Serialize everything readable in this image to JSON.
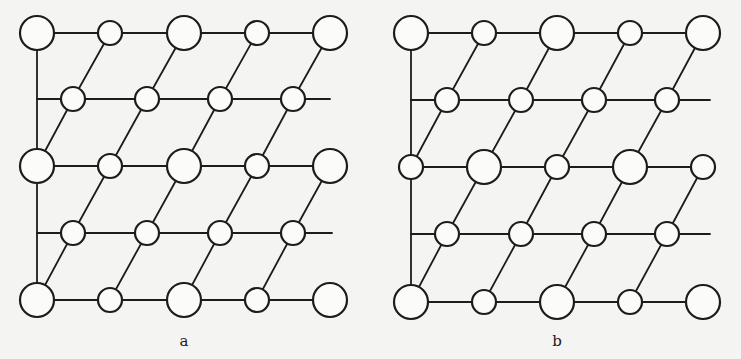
{
  "figure": {
    "colors": {
      "background": "#f4f4f2",
      "stroke": "#1c1c1c",
      "atom_fill": "#fbfbf9"
    },
    "radius": {
      "large": 17,
      "small": 12
    }
  },
  "panels": [
    {
      "id": "a",
      "label": "a",
      "label_pos": [
        184,
        346
      ],
      "vertical_line": {
        "x": 37,
        "y1": 33,
        "y2": 300
      },
      "rows": [
        {
          "y": 33,
          "line_end": 330,
          "atoms": [
            [
              37,
              "L"
            ],
            [
              110,
              "S"
            ],
            [
              184,
              "L"
            ],
            [
              257,
              "S"
            ],
            [
              330,
              "L"
            ]
          ]
        },
        {
          "y": 99,
          "line_end": 330,
          "atoms": [
            [
              73,
              "S"
            ],
            [
              147,
              "S"
            ],
            [
              220,
              "S"
            ],
            [
              293,
              "S"
            ]
          ]
        },
        {
          "y": 166,
          "line_end": 330,
          "atoms": [
            [
              37,
              "L"
            ],
            [
              110,
              "S"
            ],
            [
              184,
              "L"
            ],
            [
              257,
              "S"
            ],
            [
              330,
              "L"
            ]
          ]
        },
        {
          "y": 233,
          "line_end": 332,
          "atoms": [
            [
              73,
              "S"
            ],
            [
              147,
              "S"
            ],
            [
              220,
              "S"
            ],
            [
              293,
              "S"
            ]
          ]
        },
        {
          "y": 300,
          "line_end": 330,
          "atoms": [
            [
              37,
              "L"
            ],
            [
              110,
              "S"
            ],
            [
              184,
              "L"
            ],
            [
              257,
              "S"
            ],
            [
              330,
              "L"
            ]
          ]
        }
      ]
    },
    {
      "id": "b",
      "label": "b",
      "label_pos": [
        557,
        346
      ],
      "vertical_line": {
        "x": 411,
        "y1": 33,
        "y2": 302
      },
      "rows": [
        {
          "y": 33,
          "line_end": 703,
          "atoms": [
            [
              411,
              "L"
            ],
            [
              484,
              "S"
            ],
            [
              557,
              "L"
            ],
            [
              630,
              "S"
            ],
            [
              703,
              "L"
            ]
          ]
        },
        {
          "y": 100,
          "line_end": 710,
          "atoms": [
            [
              447,
              "S"
            ],
            [
              521,
              "S"
            ],
            [
              594,
              "S"
            ],
            [
              667,
              "S"
            ]
          ]
        },
        {
          "y": 167,
          "line_end": 703,
          "atoms": [
            [
              411,
              "S"
            ],
            [
              484,
              "L"
            ],
            [
              557,
              "S"
            ],
            [
              630,
              "L"
            ],
            [
              703,
              "S"
            ]
          ]
        },
        {
          "y": 234,
          "line_end": 710,
          "atoms": [
            [
              447,
              "S"
            ],
            [
              521,
              "S"
            ],
            [
              594,
              "S"
            ],
            [
              667,
              "S"
            ]
          ]
        },
        {
          "y": 302,
          "line_end": 703,
          "atoms": [
            [
              411,
              "L"
            ],
            [
              484,
              "S"
            ],
            [
              557,
              "L"
            ],
            [
              630,
              "S"
            ],
            [
              703,
              "L"
            ]
          ]
        }
      ]
    }
  ]
}
